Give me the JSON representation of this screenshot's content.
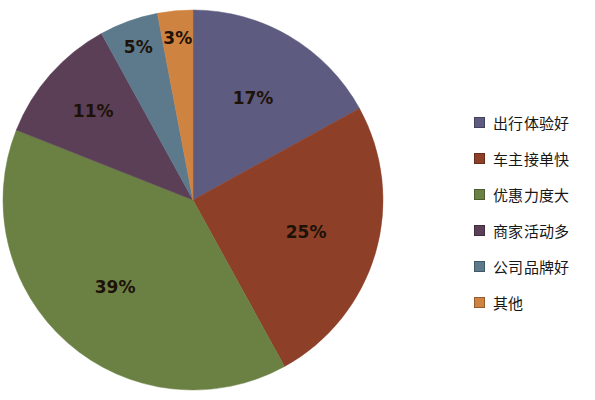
{
  "chart_data": {
    "type": "pie",
    "title": "",
    "subtitle": "",
    "xlabel": "",
    "ylabel": "",
    "legend_position": "right",
    "grid": false,
    "start_angle_deg": 0,
    "direction": "clockwise",
    "labels_inside": true,
    "label_suffix": "%",
    "categories": [
      "出行体验好",
      "车主接单快",
      "优惠力度大",
      "商家活动多",
      "公司品牌好",
      "其他"
    ],
    "values": [
      17,
      25,
      39,
      11,
      5,
      3
    ],
    "value_labels": [
      "17%",
      "25%",
      "39%",
      "11%",
      "5%",
      "3%"
    ],
    "colors": [
      "#5d5b7f",
      "#8e3f28",
      "#6b8144",
      "#5a3f57",
      "#5d7a8c",
      "#cf8340"
    ],
    "slices": [
      {
        "label": "出行体验好",
        "value": 17,
        "display": "17%",
        "color": "#5d5b7f"
      },
      {
        "label": "车主接单快",
        "value": 25,
        "display": "25%",
        "color": "#8e3f28"
      },
      {
        "label": "优惠力度大",
        "value": 39,
        "display": "39%",
        "color": "#6b8144"
      },
      {
        "label": "商家活动多",
        "value": 11,
        "display": "11%",
        "color": "#5a3f57"
      },
      {
        "label": "公司品牌好",
        "value": 5,
        "display": "5%",
        "color": "#5d7a8c"
      },
      {
        "label": "其他",
        "value": 3,
        "display": "3%",
        "color": "#cf8340"
      }
    ],
    "total": 100
  },
  "legend": {
    "items": [
      {
        "label": "出行体验好",
        "color": "#5d5b7f"
      },
      {
        "label": "车主接单快",
        "color": "#8e3f28"
      },
      {
        "label": "优惠力度大",
        "color": "#6b8144"
      },
      {
        "label": "商家活动多",
        "color": "#5a3f57"
      },
      {
        "label": "公司品牌好",
        "color": "#5d7a8c"
      },
      {
        "label": "其他",
        "color": "#cf8340"
      }
    ]
  },
  "geometry": {
    "center_x": 193,
    "center_y": 200,
    "radius": 190
  }
}
